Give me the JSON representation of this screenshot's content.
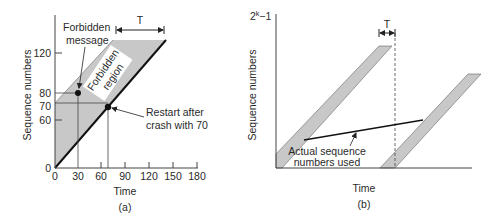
{
  "panel_a": {
    "caption": "(a)",
    "x_label": "Time",
    "y_label": "Sequence numbers",
    "x_ticks": [
      "0",
      "30",
      "60",
      "90",
      "120",
      "150",
      "180"
    ],
    "y_ticks": [
      "0",
      "60",
      "70",
      "80",
      "120"
    ],
    "interval_label": "T",
    "forbidden_message_label_1": "Forbidden",
    "forbidden_message_label_2": "message",
    "forbidden_region_label_1": "Forbidden",
    "forbidden_region_label_2": "region",
    "restart_label_1": "Restart after",
    "restart_label_2": "crash with 70",
    "region_fill": "#c8c8c8",
    "line_color": "#111111"
  },
  "panel_b": {
    "caption": "(b)",
    "x_label": "Time",
    "y_label": "Sequence numbers",
    "y_top_label_base": "2",
    "y_top_label_exp": "k",
    "y_top_label_suffix": "−1",
    "interval_label": "T",
    "actual_label_1": "Actual sequence",
    "actual_label_2": "numbers used",
    "band_fill": "#c8c8c8"
  }
}
